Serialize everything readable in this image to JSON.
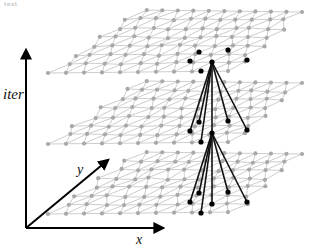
{
  "figure": {
    "width": 312,
    "height": 245,
    "faint_top_text": "text",
    "colors": {
      "mesh_edge": "#b8b8b8",
      "mesh_node": "#a8a8a8",
      "active_node": "#000000",
      "connection": "#111111",
      "axis": "#000000"
    },
    "axes": {
      "origin": [
        26,
        228
      ],
      "iter": {
        "label": "iter",
        "tip": [
          26,
          50
        ],
        "label_pos": [
          3,
          86
        ]
      },
      "x": {
        "label": "x",
        "tip": [
          163,
          228
        ],
        "label_pos": [
          136,
          232
        ]
      },
      "y": {
        "label": "y",
        "tip": [
          108,
          160
        ],
        "label_pos": [
          77,
          162
        ]
      }
    },
    "layers": [
      {
        "name": "layer-top",
        "front_left": [
          48,
          73
        ],
        "front_right": [
          237,
          71
        ],
        "back_left": [
          139,
          10
        ],
        "back_right": [
          302,
          12
        ],
        "active_nodes": [
          [
            199,
            52
          ],
          [
            228,
            50
          ],
          [
            190,
            61
          ],
          [
            247,
            60
          ],
          [
            212,
            62
          ],
          [
            201,
            71
          ]
        ],
        "hub": [
          212,
          62
        ]
      },
      {
        "name": "layer-middle",
        "front_left": [
          48,
          144
        ],
        "front_right": [
          237,
          142
        ],
        "back_left": [
          139,
          81
        ],
        "back_right": [
          302,
          83
        ],
        "active_nodes": [
          [
            199,
            122
          ],
          [
            228,
            121
          ],
          [
            190,
            131
          ],
          [
            247,
            130
          ],
          [
            212,
            133
          ],
          [
            201,
            142
          ]
        ],
        "hub": [
          212,
          133
        ]
      },
      {
        "name": "layer-bottom",
        "front_left": [
          48,
          214
        ],
        "front_right": [
          237,
          212
        ],
        "back_left": [
          139,
          152
        ],
        "back_right": [
          302,
          154
        ],
        "active_nodes": [
          [
            199,
            193
          ],
          [
            228,
            192
          ],
          [
            190,
            202
          ],
          [
            247,
            202
          ],
          [
            212,
            204
          ],
          [
            201,
            213
          ]
        ],
        "hub": [
          212,
          204
        ]
      }
    ],
    "grid": {
      "rows": 7,
      "cols": 10,
      "jitter_seed": 7,
      "jitter": 2.2
    }
  }
}
